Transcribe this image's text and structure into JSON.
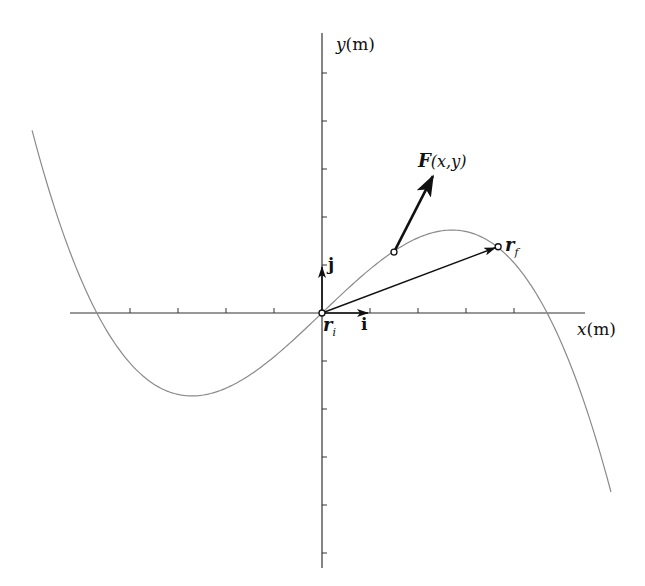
{
  "diagram": {
    "title": "",
    "axes": {
      "x_label_var": "x",
      "x_label_unit": "(m)",
      "y_label_var": "y",
      "y_label_unit": "(m)",
      "origin_px": [
        322,
        313
      ],
      "unit_px": 48,
      "x_ticks": [
        -4,
        -3,
        -2,
        -1,
        1,
        2,
        3,
        4
      ],
      "y_ticks": [
        -5,
        -4,
        -3,
        -2,
        -1,
        1,
        2,
        3,
        4,
        5
      ],
      "x_range": [
        -5.2,
        5.5
      ],
      "y_range": [
        -5.3,
        5.8
      ]
    },
    "curve": {
      "description": "cubic path y = -k·x·(x² - 22)",
      "k": 0.0435,
      "x_start": -6.04,
      "x_end": 6.02,
      "color": "#8a8a8a"
    },
    "unit_vectors": {
      "i_label": "i",
      "j_label": "j"
    },
    "points": {
      "ri_label": "r",
      "ri_sub": "i",
      "rf_label": "r",
      "rf_sub": "f",
      "rf_xy": [
        3.67,
        1.38
      ]
    },
    "force": {
      "label_var": "F",
      "label_args": "(x,y)",
      "base_xy": [
        1.5,
        1.27
      ],
      "tip_xy": [
        2.31,
        2.85
      ]
    },
    "colors": {
      "axis": "#333333",
      "curve": "#8a8a8a",
      "vector": "#111111",
      "background": "#ffffff"
    }
  }
}
